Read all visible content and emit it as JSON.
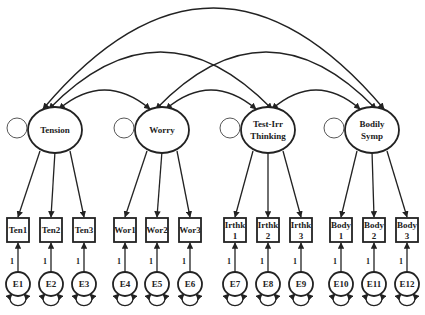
{
  "diagram": {
    "type": "confirmatory factor analysis path diagram",
    "latent_factors": [
      {
        "id": "tension",
        "label_lines": [
          "Tension"
        ],
        "cx": 55,
        "cy": 130
      },
      {
        "id": "worry",
        "label_lines": [
          "Worry"
        ],
        "cx": 162,
        "cy": 130
      },
      {
        "id": "testirr",
        "label_lines": [
          "Test-Irr",
          "Thinking"
        ],
        "cx": 268,
        "cy": 130
      },
      {
        "id": "bodily",
        "label_lines": [
          "Bodily",
          "Symp"
        ],
        "cx": 372,
        "cy": 130
      }
    ],
    "indicators": [
      {
        "label_lines": [
          "Ten1"
        ],
        "factor": "tension",
        "x": 18
      },
      {
        "label_lines": [
          "Ten2"
        ],
        "factor": "tension",
        "x": 51
      },
      {
        "label_lines": [
          "Ten3"
        ],
        "factor": "tension",
        "x": 84
      },
      {
        "label_lines": [
          "Wor1"
        ],
        "factor": "worry",
        "x": 125
      },
      {
        "label_lines": [
          "Wor2"
        ],
        "factor": "worry",
        "x": 157
      },
      {
        "label_lines": [
          "Wor3"
        ],
        "factor": "worry",
        "x": 190
      },
      {
        "label_lines": [
          "Irthk",
          "1"
        ],
        "factor": "testirr",
        "x": 235
      },
      {
        "label_lines": [
          "Irthk",
          "2"
        ],
        "factor": "testirr",
        "x": 268
      },
      {
        "label_lines": [
          "Irthk",
          "3"
        ],
        "factor": "testirr",
        "x": 301
      },
      {
        "label_lines": [
          "Body",
          "1"
        ],
        "factor": "bodily",
        "x": 341
      },
      {
        "label_lines": [
          "Body",
          "2"
        ],
        "factor": "bodily",
        "x": 374
      },
      {
        "label_lines": [
          "Body",
          "3"
        ],
        "factor": "bodily",
        "x": 407
      }
    ],
    "errors": [
      "E1",
      "E2",
      "E3",
      "E4",
      "E5",
      "E6",
      "E7",
      "E8",
      "E9",
      "E10",
      "E11",
      "E12"
    ],
    "error_path_label": "1",
    "covariances": [
      {
        "from": "tension",
        "to": "bodily"
      },
      {
        "from": "tension",
        "to": "testirr"
      },
      {
        "from": "worry",
        "to": "bodily"
      },
      {
        "from": "tension",
        "to": "worry"
      },
      {
        "from": "worry",
        "to": "testirr"
      },
      {
        "from": "testirr",
        "to": "bodily"
      }
    ]
  }
}
